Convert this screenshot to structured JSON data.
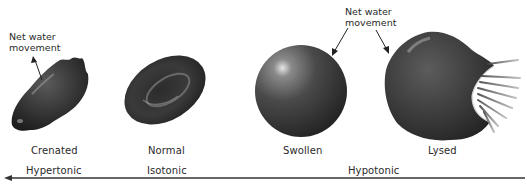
{
  "figure": {
    "cells": [
      {
        "id": "crenated",
        "label": "Crenated",
        "annotation": "Net water movement",
        "annotation_direction": "out of cell"
      },
      {
        "id": "normal",
        "label": "Normal"
      },
      {
        "id": "swollen",
        "label": "Swollen",
        "annotation": "Net water movement",
        "annotation_direction": "into cell"
      },
      {
        "id": "lysed",
        "label": "Lysed"
      }
    ],
    "annotations": {
      "left": {
        "line1": "Net water",
        "line2": "movement"
      },
      "right": {
        "line1": "Net water",
        "line2": "movement"
      }
    },
    "axis": {
      "direction": "arrow pointing left (increasing tonicity)",
      "labels": [
        "Hypertonic",
        "Isotonic",
        "Hypotonic"
      ]
    },
    "colors": {
      "cell_dark": "#2b2b2b",
      "cell_mid": "#555555",
      "highlight": "#d8d8d8",
      "axis_line": "#333333",
      "text": "#2a2a2a"
    }
  }
}
